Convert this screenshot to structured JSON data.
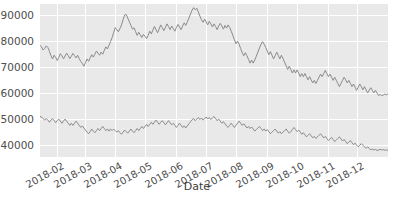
{
  "chart_data": {
    "type": "line",
    "title": "",
    "xlabel": "Date",
    "ylabel": "",
    "grid": true,
    "legend": "none",
    "xlim": [
      "2018-01-15",
      "2018-12-31"
    ],
    "ylim": [
      35500,
      94000
    ],
    "yticks": [
      40000,
      50000,
      60000,
      70000,
      80000,
      90000
    ],
    "ytick_labels": [
      "40000",
      "50000",
      "60000",
      "70000",
      "80000",
      "90000"
    ],
    "xticks": [
      "2018-02",
      "2018-03",
      "2018-04",
      "2018-05",
      "2018-06",
      "2018-07",
      "2018-08",
      "2018-09",
      "2018-10",
      "2018-11",
      "2018-12"
    ],
    "xtick_labels": [
      "2018-02",
      "2018-03",
      "2018-04",
      "2018-05",
      "2018-06",
      "2018-07",
      "2018-08",
      "2018-09",
      "2018-10",
      "2018-11",
      "2018-12"
    ],
    "colors": {
      "line": "#8a8a8a",
      "panel": "#e9e9e9",
      "grid": "#ffffff",
      "text": "#4d4d4d"
    },
    "series": [
      {
        "name": "upper",
        "color": "#8a8a8a",
        "values": [
          78200,
          77600,
          76400,
          77000,
          78000,
          77400,
          75900,
          74200,
          73000,
          74400,
          73600,
          72400,
          73600,
          75000,
          74200,
          73000,
          74100,
          75200,
          74300,
          73100,
          74000,
          75100,
          74300,
          73400,
          74400,
          73200,
          72000,
          71300,
          70200,
          71600,
          73000,
          72100,
          73400,
          74600,
          73700,
          74800,
          76000,
          75200,
          74400,
          75600,
          74800,
          76200,
          77600,
          76800,
          78200,
          79600,
          81200,
          83000,
          85000,
          84200,
          83400,
          84600,
          86000,
          88000,
          89800,
          90000,
          88600,
          87200,
          85800,
          84400,
          84900,
          83400,
          82000,
          83200,
          82200,
          81200,
          82400,
          81600,
          80800,
          82000,
          83600,
          82600,
          84000,
          85400,
          84200,
          83000,
          84400,
          86000,
          85000,
          83800,
          85000,
          86400,
          85400,
          84200,
          85600,
          84600,
          83600,
          85000,
          86200,
          85200,
          84200,
          85600,
          86800,
          85800,
          87200,
          88600,
          90200,
          91600,
          92600,
          91800,
          92400,
          91000,
          89400,
          88000,
          87000,
          88200,
          87200,
          86000,
          87400,
          86400,
          85200,
          86400,
          85400,
          84200,
          85600,
          86600,
          85600,
          84400,
          85800,
          84800,
          86000,
          85000,
          83600,
          82000,
          80400,
          78800,
          79800,
          78600,
          77000,
          75400,
          74200,
          75400,
          74200,
          72800,
          71400,
          72600,
          71400,
          72600,
          74000,
          75600,
          77200,
          78600,
          79600,
          78600,
          77400,
          76000,
          74600,
          75800,
          74400,
          73000,
          74200,
          75600,
          74400,
          73000,
          74400,
          73200,
          71800,
          70400,
          69000,
          70200,
          69000,
          67600,
          68800,
          67600,
          68800,
          67600,
          66200,
          67400,
          66200,
          67400,
          66200,
          65000,
          66200,
          65000,
          63800,
          64800,
          63600,
          64800,
          66000,
          67200,
          66200,
          67400,
          68600,
          67400,
          66200,
          67200,
          66000,
          64800,
          66000,
          64800,
          63600,
          62400,
          63600,
          64800,
          66000,
          65000,
          63800,
          64800,
          63600,
          62400,
          63400,
          62200,
          61000,
          62200,
          63400,
          62400,
          61200,
          62400,
          61200,
          60000,
          61000,
          62000,
          61000,
          60000,
          61000,
          60000,
          59000,
          59400,
          59000,
          59200,
          59600,
          59200,
          59800
        ]
      },
      {
        "name": "lower",
        "color": "#8a8a8a",
        "values": [
          51000,
          50800,
          50200,
          49600,
          50200,
          49600,
          48800,
          49600,
          50200,
          49400,
          48600,
          49400,
          50000,
          49200,
          48400,
          49200,
          50000,
          49200,
          48400,
          47600,
          48400,
          47600,
          48400,
          49200,
          48400,
          47600,
          46800,
          47400,
          46600,
          45800,
          45000,
          44400,
          45200,
          46200,
          45400,
          44800,
          45600,
          46400,
          45600,
          46400,
          47200,
          46400,
          45600,
          46200,
          45400,
          46200,
          45600,
          46200,
          45600,
          45000,
          45600,
          44800,
          44200,
          45000,
          45800,
          45200,
          44600,
          45400,
          46200,
          45400,
          44800,
          45600,
          46400,
          45600,
          46400,
          47200,
          46400,
          47200,
          48000,
          47200,
          48000,
          48800,
          48000,
          48800,
          49600,
          48800,
          48000,
          48800,
          49400,
          48600,
          47800,
          48600,
          49400,
          48600,
          47800,
          48400,
          47600,
          46800,
          47600,
          48400,
          47600,
          46800,
          47400,
          46600,
          47400,
          48200,
          49000,
          49800,
          50200,
          49400,
          50000,
          50600,
          49800,
          50400,
          49600,
          50200,
          50800,
          50000,
          50600,
          49800,
          50400,
          51000,
          50200,
          49400,
          50000,
          49200,
          48400,
          49000,
          48200,
          47400,
          46800,
          47600,
          48400,
          47600,
          46800,
          47600,
          48400,
          49200,
          48400,
          47600,
          48200,
          47400,
          46600,
          47200,
          46400,
          47000,
          46200,
          45400,
          46000,
          46600,
          47200,
          46400,
          45600,
          46200,
          45400,
          46000,
          45200,
          44400,
          45000,
          45600,
          46200,
          45400,
          44600,
          45200,
          44400,
          45000,
          45600,
          46200,
          45400,
          44600,
          45200,
          46000,
          46800,
          46000,
          45200,
          45800,
          45000,
          44200,
          44800,
          44000,
          43200,
          43800,
          44400,
          43600,
          42800,
          43400,
          42600,
          43200,
          43800,
          44400,
          43600,
          42800,
          43400,
          42600,
          41800,
          42400,
          43000,
          42200,
          41400,
          42000,
          42600,
          43200,
          42400,
          41600,
          42200,
          41400,
          40600,
          41200,
          41800,
          41000,
          40200,
          40800,
          40000,
          39400,
          40000,
          40600,
          40000,
          39400,
          38800,
          39400,
          38800,
          38200,
          38600,
          38200,
          38400,
          38000,
          38200,
          38400,
          38200,
          38300,
          38100,
          38200,
          38100
        ]
      }
    ]
  }
}
